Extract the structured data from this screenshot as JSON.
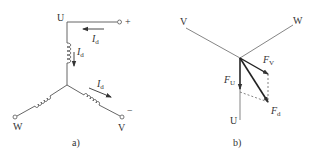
{
  "diagram": {
    "panel_a": {
      "caption": "a)",
      "description": "Star-connected three-phase winding with DC current I_d injected from U to V",
      "nodes": {
        "U": "U",
        "V": "V",
        "W": "W"
      },
      "terminals": {
        "plus": "+",
        "minus": "−"
      },
      "currents": [
        {
          "symbol": "I",
          "subscript": "d",
          "location": "top lead, arrow pointing left"
        },
        {
          "symbol": "I",
          "subscript": "d",
          "location": "U winding, arrow pointing down"
        },
        {
          "symbol": "I",
          "subscript": "d",
          "location": "V winding, arrow pointing toward V"
        }
      ]
    },
    "panel_b": {
      "caption": "b)",
      "description": "Phasor diagram of magnetomotive forces",
      "axes": {
        "U": "U",
        "V": "V",
        "W": "W"
      },
      "vectors": [
        {
          "symbol": "F",
          "subscript": "U",
          "direction": "along U axis (down)"
        },
        {
          "symbol": "F",
          "subscript": "V",
          "direction": "opposite V axis (down-right)"
        },
        {
          "symbol": "F",
          "subscript": "d",
          "direction": "resultant F_U + F_V"
        }
      ]
    }
  }
}
